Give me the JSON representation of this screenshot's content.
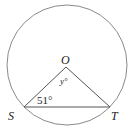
{
  "diagram": {
    "type": "circle-geometry",
    "circle": {
      "center_label": "O",
      "stroke": "#888888"
    },
    "points": [
      {
        "label": "O",
        "role": "center"
      },
      {
        "label": "S",
        "role": "on-circle"
      },
      {
        "label": "T",
        "role": "on-circle"
      }
    ],
    "segments": [
      "OS",
      "OT",
      "ST"
    ],
    "angles": [
      {
        "vertex": "O",
        "label": "y°"
      },
      {
        "vertex": "S",
        "label": "51°"
      }
    ]
  }
}
